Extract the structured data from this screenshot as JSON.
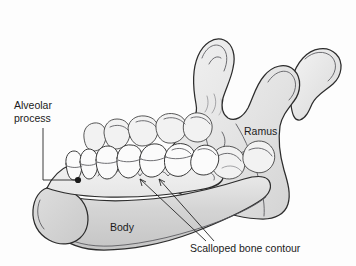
{
  "figure": {
    "view": "three-quarter lateral",
    "background_color": "#fdfdfd"
  },
  "labels": [
    {
      "id": "alveolar-process",
      "line1": "Alveolar",
      "line2": "process",
      "text": "Alveolar process",
      "x": 14,
      "y": 106,
      "pointer": "dot",
      "target_x": 78,
      "target_y": 180
    },
    {
      "id": "ramus",
      "text": "Ramus",
      "x": 244,
      "y": 132,
      "pointer": "none"
    },
    {
      "id": "body",
      "text": "Body",
      "x": 110,
      "y": 228,
      "pointer": "none"
    },
    {
      "id": "scalloped-bone-contour",
      "text": "Scalloped bone contour",
      "x": 190,
      "y": 249,
      "pointer": "arrows",
      "arrow_tips": [
        {
          "x": 139,
          "y": 178
        },
        {
          "x": 158,
          "y": 178
        }
      ]
    }
  ],
  "colors": {
    "outline": "#2c2c2c",
    "bone_light": "#f0f0f0",
    "bone_mid": "#dcdcdc",
    "bone_dark": "#c8c8c8",
    "tooth": "#fbfbfb",
    "tooth_far": "#f2f2f2",
    "text": "#1b1b1b",
    "leader": "#262626",
    "background": "#fdfdfd"
  },
  "anatomy_parts": [
    {
      "id": "condyle",
      "name": "Condyle"
    },
    {
      "id": "coronoid-process",
      "name": "Coronoid process"
    },
    {
      "id": "sigmoid-notch",
      "name": "Sigmoid notch"
    },
    {
      "id": "ramus-plate",
      "name": "Ramus"
    },
    {
      "id": "angle",
      "name": "Angle of mandible"
    },
    {
      "id": "body-plate",
      "name": "Body"
    },
    {
      "id": "mentum",
      "name": "Chin / mentum"
    },
    {
      "id": "alveolar-ridge",
      "name": "Alveolar ridge"
    },
    {
      "id": "near-teeth-row",
      "name": "Near dental arch"
    },
    {
      "id": "far-teeth-row",
      "name": "Far dental arch"
    }
  ]
}
